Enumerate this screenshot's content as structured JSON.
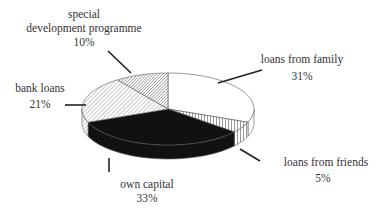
{
  "chart_data": {
    "type": "pie",
    "style": "3d",
    "title": "",
    "start_angle_deg": 90,
    "direction": "clockwise",
    "slices": [
      {
        "label": "loans from family",
        "value": 31,
        "value_label": "31%",
        "fill": "white"
      },
      {
        "label": "loans from friends",
        "value": 5,
        "value_label": "5%",
        "fill": "vertical-hatch"
      },
      {
        "label": "own capital",
        "value": 33,
        "value_label": "33%",
        "fill": "black"
      },
      {
        "label": "bank loans",
        "value": 21,
        "value_label": "21%",
        "fill": "light-diagonal-hatch"
      },
      {
        "label": "special development programme",
        "value": 10,
        "value_label": "10%",
        "fill": "dense-diagonal-hatch"
      }
    ],
    "legend": "none",
    "labels": "outside-with-leader-lines"
  },
  "labels": {
    "family": {
      "line1": "loans from family",
      "line2": "31%"
    },
    "friends": {
      "line1": "loans from friends",
      "line2": "5%"
    },
    "capital": {
      "line1": "own capital",
      "line2": "33%"
    },
    "bank": {
      "line1": "bank loans",
      "line2": "21%"
    },
    "special": {
      "line1": "special",
      "line2": "development programme",
      "line3": "10%"
    }
  }
}
